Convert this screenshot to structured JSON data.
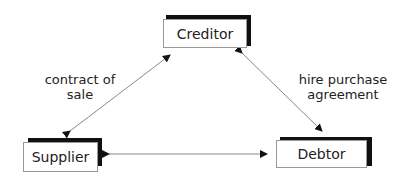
{
  "diagram": {
    "nodes": {
      "creditor": {
        "label": "Creditor"
      },
      "supplier": {
        "label": "Supplier"
      },
      "debtor": {
        "label": "Debtor"
      }
    },
    "edges": [
      {
        "from": "supplier",
        "to": "creditor",
        "label_line1": "contract of",
        "label_line2": "sale",
        "direction": "bidirectional"
      },
      {
        "from": "creditor",
        "to": "debtor",
        "label_line1": "hire purchase",
        "label_line2": "agreement",
        "direction": "bidirectional"
      },
      {
        "from": "supplier",
        "to": "debtor",
        "label_line1": "",
        "label_line2": "",
        "direction": "bidirectional"
      }
    ]
  }
}
